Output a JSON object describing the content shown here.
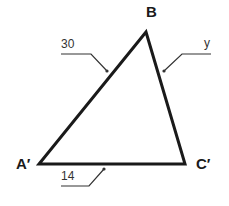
{
  "diagram": {
    "type": "triangle",
    "vertices": {
      "top": "B",
      "left": "A′",
      "right": "C′"
    },
    "sides": {
      "left_side": "30",
      "right_side": "y",
      "bottom_side": "14"
    },
    "colors": {
      "stroke": "#1a1a1a",
      "leader": "#333333",
      "background": "#ffffff"
    }
  }
}
